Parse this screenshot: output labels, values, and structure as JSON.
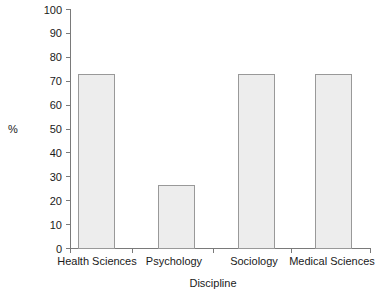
{
  "chart_data": {
    "type": "bar",
    "title": "",
    "subtitle": "",
    "xlabel": "Discipline",
    "ylabel": "%",
    "categories": [
      "Health Sciences",
      "Psychology",
      "Sociology",
      "Medical Sciences"
    ],
    "values": [
      50,
      73,
      26.5,
      73
    ],
    "series": [
      {
        "name": "%",
        "values": [
          50,
          73,
          26.5,
          73
        ]
      }
    ],
    "ylim": [
      0,
      100
    ],
    "y_ticks": [
      0,
      10,
      20,
      30,
      40,
      50,
      60,
      70,
      80,
      90,
      100
    ],
    "y_tick_labels": [
      "0",
      "10",
      "20",
      "30",
      "40",
      "50",
      "60",
      "70",
      "80",
      "90",
      "100"
    ],
    "grid": false,
    "legend": false,
    "legend_position": "none",
    "annotations": [],
    "colors": {
      "bar_fill": "#ededed",
      "bar_border": "#999999",
      "axis": "#7a7a7a",
      "text": "#1a1a1a",
      "background": "#ffffff"
    }
  }
}
